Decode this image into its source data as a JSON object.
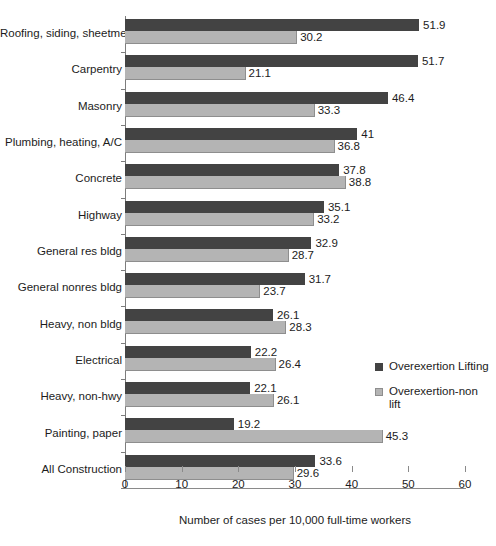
{
  "chart_data": {
    "type": "bar",
    "orientation": "horizontal",
    "title": "",
    "xlabel": "Number of cases per 10,000 full-time workers",
    "ylabel": "",
    "xlim": [
      0,
      60
    ],
    "xticks": [
      0,
      10,
      20,
      30,
      40,
      50,
      60
    ],
    "xtick_labels": [
      "0",
      "10",
      "20",
      "30",
      "40",
      "50",
      "60"
    ],
    "grid": false,
    "legend_position": "right-middle",
    "categories": [
      "Roofing, siding, sheetmetal",
      "Carpentry",
      "Masonry",
      "Plumbing, heating, A/C",
      "Concrete",
      "Highway",
      "General res bldg",
      "General nonres bldg",
      "Heavy, non bldg",
      "Electrical",
      "Heavy, non-hwy",
      "Painting, paper",
      "All Construction"
    ],
    "series": [
      {
        "name": "Overexertion Lifting",
        "color": "#434343",
        "values": [
          51.9,
          51.7,
          46.4,
          41,
          37.8,
          35.1,
          32.9,
          31.7,
          26.1,
          22.2,
          22.1,
          19.2,
          33.6
        ],
        "labels": [
          "51.9",
          "51.7",
          "46.4",
          "41",
          "37.8",
          "35.1",
          "32.9",
          "31.7",
          "26.1",
          "22.2",
          "22.1",
          "19.2",
          "33.6"
        ]
      },
      {
        "name": "Overexertion-non lift",
        "color": "#b4b4b4",
        "values": [
          30.2,
          21.1,
          33.3,
          36.8,
          38.8,
          33.2,
          28.7,
          23.7,
          28.3,
          26.4,
          26.1,
          45.3,
          29.6
        ],
        "labels": [
          "30.2",
          "21.1",
          "33.3",
          "36.8",
          "38.8",
          "33.2",
          "28.7",
          "23.7",
          "28.3",
          "26.4",
          "26.1",
          "45.3",
          "29.6"
        ]
      }
    ],
    "legend": [
      {
        "label": "Overexertion Lifting",
        "color": "#434343"
      },
      {
        "label": "Overexertion-non lift",
        "color": "#b4b4b4",
        "lines": [
          "Overexertion-non",
          "lift"
        ]
      }
    ]
  }
}
